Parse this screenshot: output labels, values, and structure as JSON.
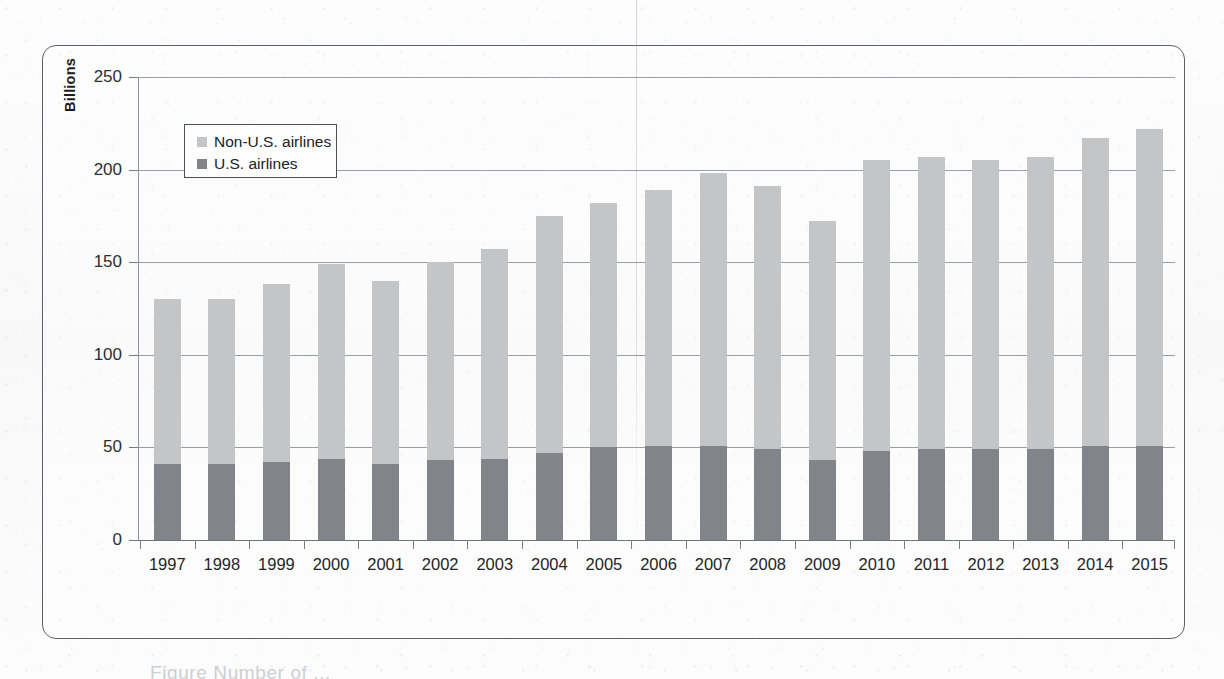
{
  "figure": {
    "yaxis_title": "Billions",
    "caption_partial": "Figure  Number of ..."
  },
  "legend": {
    "position": "inside-top-left",
    "items": [
      {
        "label": "Non-U.S. airlines",
        "color": "#c3c5c7",
        "swatch_name": "legend-swatch-non-us"
      },
      {
        "label": "U.S. airlines",
        "color": "#818489",
        "swatch_name": "legend-swatch-us"
      }
    ]
  },
  "chart_data": {
    "type": "bar",
    "stacked": true,
    "title": "",
    "subtitle": "",
    "xlabel": "",
    "ylabel": "Billions",
    "ylim": [
      0,
      250
    ],
    "yticks": [
      0,
      50,
      100,
      150,
      200,
      250
    ],
    "ytick_labels": [
      "0",
      "50",
      "100",
      "150",
      "200",
      "250"
    ],
    "grid": "horizontal",
    "legend_position": "upper left inside plot",
    "categories": [
      "1997",
      "1998",
      "1999",
      "2000",
      "2001",
      "2002",
      "2003",
      "2004",
      "2005",
      "2006",
      "2007",
      "2008",
      "2009",
      "2010",
      "2011",
      "2012",
      "2013",
      "2014",
      "2015"
    ],
    "series": [
      {
        "name": "U.S. airlines",
        "color": "#818489",
        "values": [
          41,
          41,
          42,
          44,
          41,
          43,
          44,
          47,
          50,
          51,
          51,
          49,
          43,
          48,
          49,
          49,
          49,
          51,
          51
        ]
      },
      {
        "name": "Non-U.S. airlines",
        "color": "#c3c5c7",
        "values": [
          89,
          89,
          96,
          105,
          99,
          107,
          113,
          128,
          132,
          138,
          147,
          142,
          129,
          157,
          158,
          156,
          158,
          166,
          171
        ]
      }
    ],
    "totals": [
      130,
      130,
      138,
      149,
      140,
      150,
      157,
      175,
      182,
      189,
      198,
      191,
      172,
      205,
      207,
      205,
      207,
      217,
      222
    ]
  }
}
